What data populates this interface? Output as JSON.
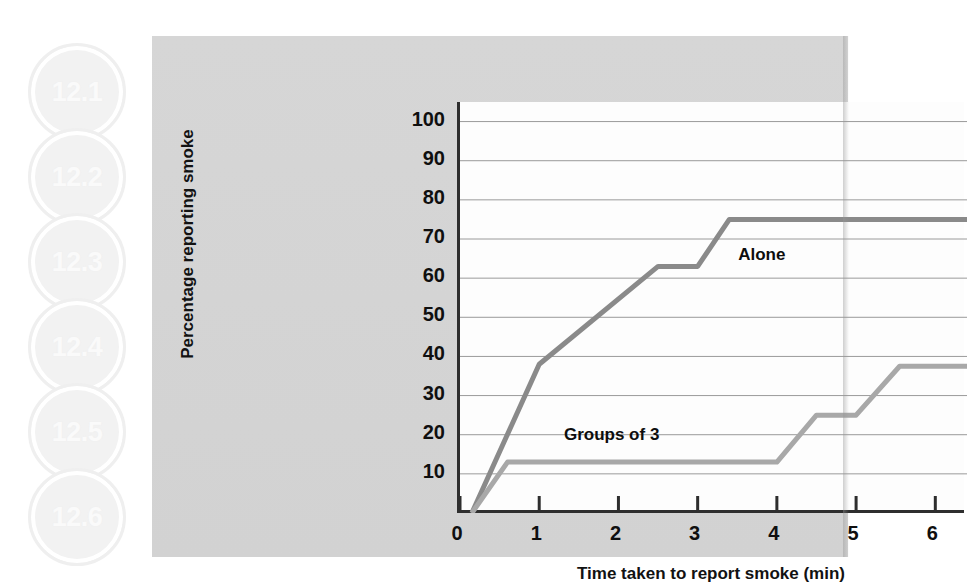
{
  "sidebar": {
    "badges": [
      {
        "label": "12.1"
      },
      {
        "label": "12.2"
      },
      {
        "label": "12.3"
      },
      {
        "label": "12.4"
      },
      {
        "label": "12.5"
      },
      {
        "label": "12.6"
      }
    ]
  },
  "colors": {
    "panel_background": "#d4d4d4",
    "plot_background": "#fdfdfd",
    "axis": "#2e2e2e",
    "gridline": "#9a9a9a",
    "alone_line": "#8a8a8a",
    "groups_line": "#a8a8a8",
    "text": "#111111",
    "badge_fill": "#f2f2f2"
  },
  "chart_data": {
    "type": "line",
    "title": "",
    "xlabel": "Time taken to report smoke (min)",
    "ylabel": "Percentage reporting smoke",
    "xlim": [
      0,
      6.4
    ],
    "ylim": [
      0,
      105
    ],
    "xticks": [
      "0",
      "1",
      "2",
      "3",
      "4",
      "5",
      "6"
    ],
    "xtick_values": [
      0,
      1,
      2,
      3,
      4,
      5,
      6
    ],
    "yticks": [
      "10",
      "20",
      "30",
      "40",
      "50",
      "60",
      "70",
      "80",
      "90",
      "100"
    ],
    "ytick_values": [
      10,
      20,
      30,
      40,
      50,
      60,
      70,
      80,
      90,
      100
    ],
    "grid": "horizontal",
    "legend": "inline-labels",
    "series": [
      {
        "name": "Alone",
        "color": "#8a8a8a",
        "label_x": 3.55,
        "label_y": 66,
        "x": [
          0.15,
          1.0,
          2.5,
          3.0,
          3.4,
          6.4
        ],
        "y": [
          0,
          38,
          63,
          63,
          75,
          75
        ]
      },
      {
        "name": "Groups of 3",
        "color": "#a8a8a8",
        "label_x": 1.35,
        "label_y": 20,
        "x": [
          0.15,
          0.6,
          4.0,
          4.5,
          5.0,
          5.55,
          6.4
        ],
        "y": [
          0,
          13,
          13,
          25,
          25,
          37.5,
          37.5
        ]
      }
    ]
  }
}
